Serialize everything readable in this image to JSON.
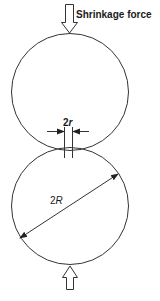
{
  "diagram": {
    "labels": {
      "force_top": "Shrinkage force",
      "neck_prefix": "2",
      "neck_var": "r",
      "diameter_prefix": "2",
      "diameter_var": "R"
    },
    "colors": {
      "stroke": "#333333",
      "background": "#ffffff"
    },
    "shapes": {
      "top_circle": {
        "cx": 70,
        "cy": 92,
        "r": 59
      },
      "bottom_circle": {
        "cx": 70,
        "cy": 206,
        "r": 59
      },
      "neck_lines_x": [
        64,
        72
      ],
      "diameter_arrow": {
        "x1": 20,
        "y1": 238,
        "x2": 118,
        "y2": 174
      }
    }
  }
}
